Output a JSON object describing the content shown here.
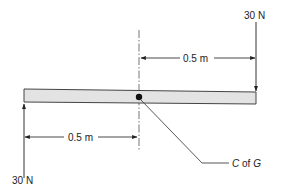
{
  "diagram": {
    "type": "beam free-body diagram",
    "beam": {
      "fill": "#e3e3e3",
      "stroke": "#444444"
    },
    "forces": [
      {
        "id": "top-right",
        "label": "30 N",
        "direction": "down",
        "position": "right end of beam"
      },
      {
        "id": "bottom-left",
        "label": "30 N",
        "direction": "up",
        "position": "left end of beam"
      }
    ],
    "dimensions": [
      {
        "id": "top",
        "label": "0.5 m",
        "from": "centre line",
        "to": "right end"
      },
      {
        "id": "bottom",
        "label": "0.5 m",
        "from": "left end",
        "to": "centre line"
      }
    ],
    "centre_of_gravity": {
      "label_parts": [
        "C",
        " of ",
        "G"
      ],
      "label": "C of G"
    },
    "colors": {
      "line": "#333333",
      "beam_fill": "#e3e3e3",
      "text": "#222222"
    }
  }
}
